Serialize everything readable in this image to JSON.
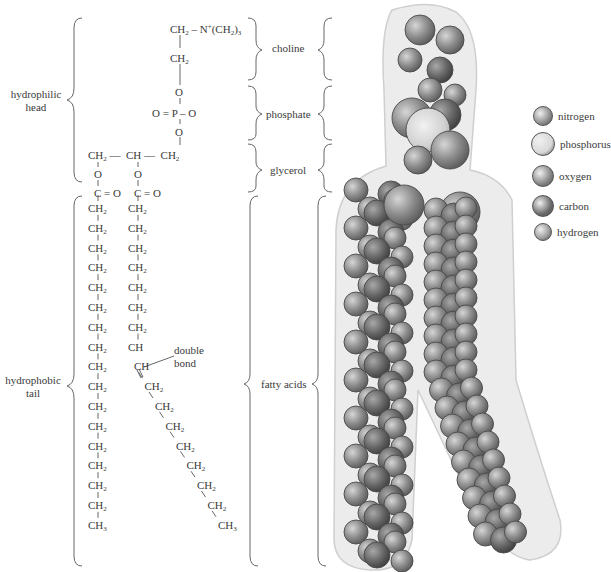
{
  "labels": {
    "hydrophilic_head": [
      "hydrophilic",
      "head"
    ],
    "hydrophobic_tail": [
      "hydrophobic",
      "tail"
    ],
    "choline": "choline",
    "phosphate": "phosphate",
    "glycerol": "glycerol",
    "fatty_acids": "fatty acids",
    "double_bond": [
      "double",
      "bond"
    ]
  },
  "structure": {
    "choline_top": "CH₂ – N⁺(CH₂)₃",
    "choline_ch2": "CH₂",
    "phosphate_o_top": "O",
    "phosphate_middle": "O = P – O",
    "phosphate_o_bottom": "O",
    "glycerol": "CH₂ —  CH —  CH₂",
    "ester_o_left": "O",
    "ester_o_right": "O",
    "carbonyl_left": "C = O",
    "carbonyl_right": "C = O",
    "chain_left": [
      "CH2",
      "CH2",
      "CH2",
      "CH2",
      "CH2",
      "CH2",
      "CH2",
      "CH2",
      "CH2",
      "CH2",
      "CH2",
      "CH2",
      "CH2",
      "CH2",
      "CH2",
      "CH2",
      "CH3"
    ],
    "chain_right_straight": [
      "CH2",
      "CH2",
      "CH2",
      "CH2",
      "CH2",
      "CH2",
      "CH2",
      "CH"
    ],
    "chain_right_kinked": [
      "CH",
      "CH2",
      "CH2",
      "CH2",
      "CH2",
      "CH2",
      "CH2",
      "CH2",
      "CH3"
    ]
  },
  "legend": [
    {
      "element": "nitrogen",
      "color": "#8c8c8c",
      "size": 20
    },
    {
      "element": "phosphorus",
      "color": "#d8d8d8",
      "size": 24
    },
    {
      "element": "oxygen",
      "color": "#858585",
      "size": 22
    },
    {
      "element": "carbon",
      "color": "#6a6a6a",
      "size": 22
    },
    {
      "element": "hydrogen",
      "color": "#9a9a9a",
      "size": 18
    }
  ]
}
